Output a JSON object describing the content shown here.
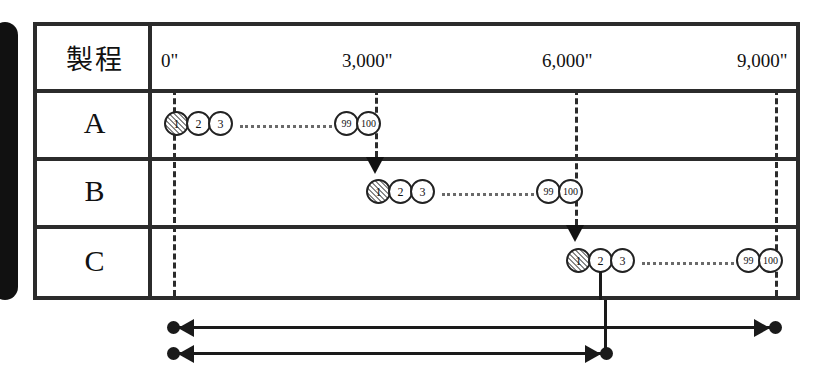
{
  "diagram": {
    "title_cell": "製程",
    "time_axis": {
      "unit_symbol": "\"",
      "ticks": [
        {
          "label": "0\"",
          "value": 0,
          "x": 173
        },
        {
          "label": "3,000\"",
          "value": 3000,
          "x": 375
        },
        {
          "label": "6,000\"",
          "value": 6000,
          "x": 575
        },
        {
          "label": "9,000\"",
          "value": 9000,
          "x": 775
        }
      ]
    },
    "rows": [
      {
        "name": "A",
        "start_time": 0,
        "start_x": 173,
        "tokens": [
          "1",
          "2",
          "3",
          "99",
          "100"
        ],
        "first_token_hatched": true,
        "ellipsis_between": "3-99"
      },
      {
        "name": "B",
        "start_time": 3000,
        "start_x": 375,
        "tokens": [
          "1",
          "2",
          "3",
          "99",
          "100"
        ],
        "first_token_hatched": true,
        "ellipsis_between": "3-99"
      },
      {
        "name": "C",
        "start_time": 6000,
        "start_x": 575,
        "tokens": [
          "1",
          "2",
          "3",
          "99",
          "100"
        ],
        "first_token_hatched": true,
        "ellipsis_between": "3-99"
      }
    ],
    "guides": [
      {
        "at_time": 0,
        "x": 173,
        "has_arrow": false,
        "spans_rows": [
          "A",
          "B",
          "C"
        ]
      },
      {
        "at_time": 3000,
        "x": 375,
        "has_arrow": true,
        "arrow_into_row": "B",
        "spans_rows": [
          "A"
        ]
      },
      {
        "at_time": 6000,
        "x": 575,
        "has_arrow": true,
        "arrow_into_row": "C",
        "spans_rows": [
          "A",
          "B"
        ]
      },
      {
        "at_time": 9000,
        "x": 775,
        "has_arrow": false,
        "spans_rows": [
          "A",
          "B",
          "C"
        ]
      }
    ],
    "span_arrows": [
      {
        "from_time": 0,
        "to_time": 9000,
        "from_x": 173,
        "to_x": 775,
        "y": 327,
        "double_headed": true
      },
      {
        "from_time": 0,
        "to_time": 6200,
        "from_x": 173,
        "to_x": 606,
        "y": 353,
        "double_headed": true
      }
    ],
    "drop_line": {
      "from_row": "C",
      "from_token": "2",
      "x": 605
    }
  },
  "colors": {
    "border": "#2b2b2b",
    "ink": "#111111",
    "hatch_fill": "#c9c9c9",
    "dotted": "#6a6a6a"
  }
}
